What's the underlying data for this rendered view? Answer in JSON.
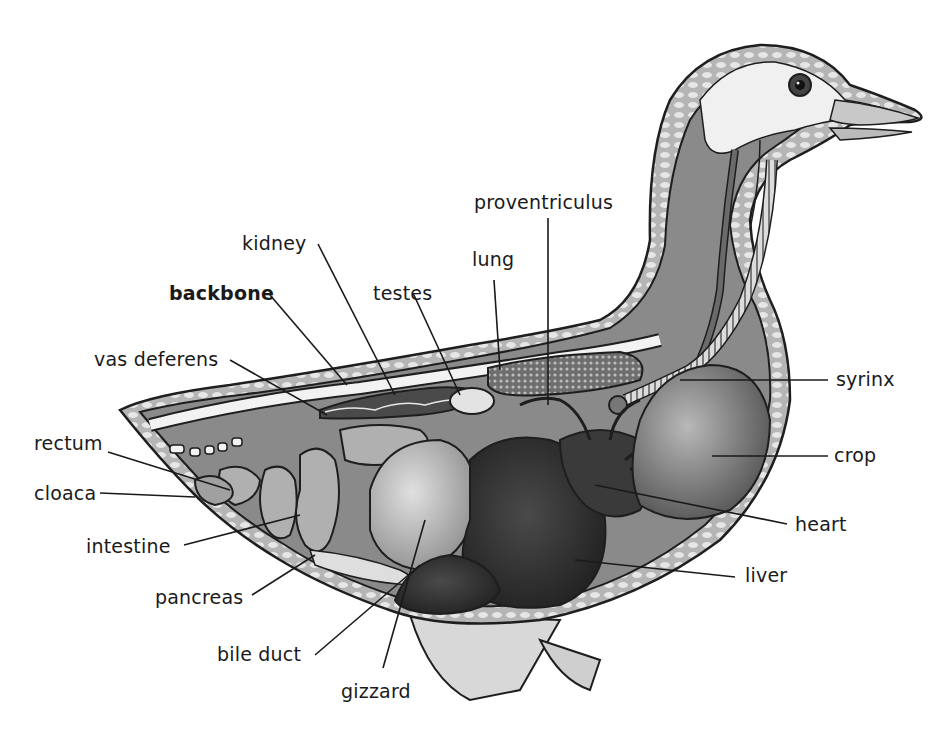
{
  "diagram": {
    "colors": {
      "outline": "#1e1e1e",
      "body_tissue": "#8a8a8a",
      "light_tissue": "#c9c9c9",
      "dark_organ": "#2e2e2e",
      "background": "#ffffff"
    },
    "labels": {
      "proventriculus": "proventriculus",
      "kidney": "kidney",
      "lung": "lung",
      "backbone": "backbone",
      "testes": "testes",
      "vas_deferens": "vas deferens",
      "syrinx": "syrinx",
      "rectum": "rectum",
      "crop": "crop",
      "cloaca": "cloaca",
      "heart": "heart",
      "intestine": "intestine",
      "liver": "liver",
      "pancreas": "pancreas",
      "bile_duct": "bile duct",
      "gizzard": "gizzard"
    }
  }
}
